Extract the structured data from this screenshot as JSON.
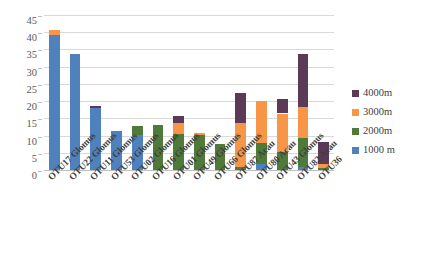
{
  "chart_data": {
    "type": "bar",
    "subtype": "stacked-column",
    "title": "",
    "xlabel": "",
    "ylabel": "",
    "ylim": [
      0,
      45
    ],
    "ytick_step": 5,
    "yticks": [
      "0",
      "5",
      "10",
      "15",
      "20",
      "25",
      "30",
      "35",
      "40",
      "45"
    ],
    "grid": true,
    "legend_position": "right",
    "categories": [
      "OTU17 Glomus",
      "OTU22 Glomus",
      "OTU11 Glomus",
      "OTU53 Glomus",
      "OTU02 Glomus",
      "OTU16 Glomus",
      "OTU01 Glomus",
      "OTU49 Glomus",
      "OTU66 Glomus",
      "OTU87 Acau",
      "OTU80 Acau",
      "OTU43 Glomus",
      "OTU82 Acau",
      "OTU36"
    ],
    "series": [
      {
        "name": "1000 m",
        "color": "#4f81bd",
        "values": [
          39.5,
          34.0,
          18.4,
          11.7,
          10.4,
          0,
          0,
          0,
          0,
          0,
          2.0,
          0,
          1.3,
          0
        ]
      },
      {
        "name": "2000m",
        "color": "#4f7a3a",
        "values": [
          0,
          0,
          0,
          0,
          2.8,
          13.3,
          10.7,
          10.6,
          7.7,
          1.3,
          6.0,
          5.5,
          8.2,
          1.0
        ]
      },
      {
        "name": "3000m",
        "color": "#f79646",
        "values": [
          1.3,
          0,
          0,
          0,
          0,
          0,
          3.3,
          0.5,
          0,
          12.6,
          12.3,
          11.2,
          9.0,
          1.0
        ]
      },
      {
        "name": "4000m",
        "color": "#5b3a58",
        "values": [
          0,
          0,
          0.4,
          0,
          0,
          0,
          2.0,
          0,
          0,
          8.8,
          0,
          4.3,
          15.5,
          6.3
        ]
      }
    ],
    "totals": [
      40.8,
      34.0,
      18.8,
      11.7,
      13.2,
      13.3,
      16.0,
      11.1,
      7.7,
      22.7,
      20.3,
      21.0,
      34.0,
      8.3
    ]
  },
  "legend": {
    "items": [
      {
        "label": "4000m",
        "color": "#5b3a58"
      },
      {
        "label": "3000m",
        "color": "#f79646"
      },
      {
        "label": "2000m",
        "color": "#4f7a3a"
      },
      {
        "label": "1000 m",
        "color": "#4f81bd"
      }
    ]
  },
  "colors": {
    "depth_4000m": "#5b3a58",
    "depth_3000m": "#f79646",
    "depth_2000m": "#4f7a3a",
    "depth_1000m": "#4f81bd",
    "gridline": "#d9d9d9",
    "axis_text": "#595959",
    "background": "#ffffff"
  }
}
